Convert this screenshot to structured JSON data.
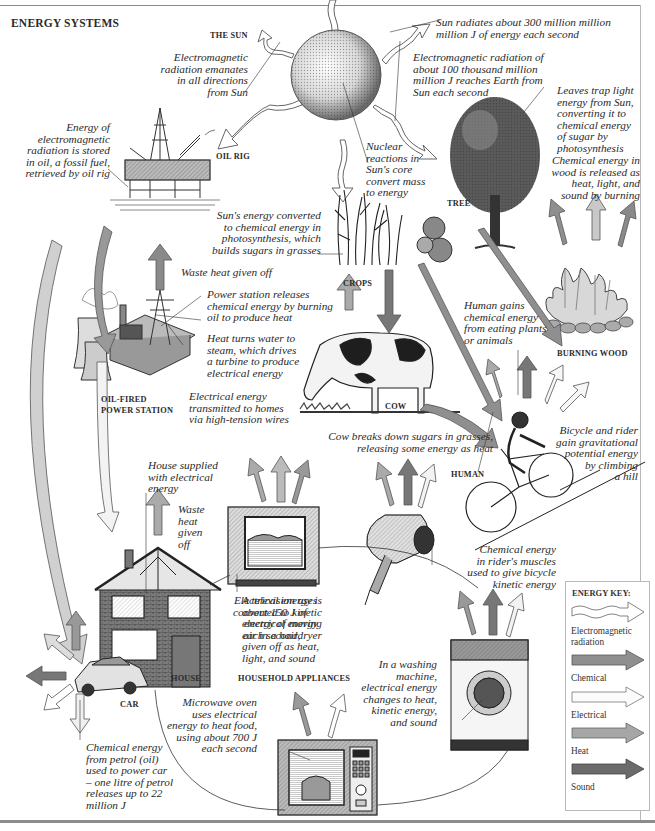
{
  "title": "ENERGY SYSTEMS",
  "labels": {
    "sun": "THE SUN",
    "oil_rig": "OIL RIG",
    "tree": "TREE",
    "crops": "CROPS",
    "burning_wood": "BURNING WOOD",
    "power_station_line1": "OIL-FIRED",
    "power_station_line2": "POWER STATION",
    "cow": "COW",
    "human": "HUMAN",
    "house": "HOUSE",
    "car": "CAR",
    "household_appliances": "HOUSEHOLD APPLIANCES"
  },
  "captions": {
    "sun_emanates": [
      "Electromagnetic",
      "radiation emanates",
      "in all directions",
      "from Sun"
    ],
    "sun_radiates": [
      "Sun radiates about 300 million million",
      "million J of energy each second"
    ],
    "reaches_earth": [
      "Electromagnetic radiation of",
      "about 100 thousand million",
      "million J reaches Earth from",
      "Sun each second"
    ],
    "oil_stored": [
      "Energy of",
      "electromagnetic",
      "radiation is stored",
      "in oil, a fossil fuel,",
      "retrieved by oil rig"
    ],
    "nuclear": [
      "Nuclear",
      "reactions in",
      "Sun's core",
      "convert mass",
      "to energy"
    ],
    "leaves": [
      "Leaves trap light",
      "energy from Sun,",
      "converting it to",
      "chemical energy",
      "of sugar by",
      "photosynthesis"
    ],
    "wood_released": [
      "Chemical energy in",
      "wood is released as",
      "heat, light, and",
      "sound by burning"
    ],
    "photosynthesis": [
      "Sun's energy converted",
      "to chemical energy in",
      "photosynthesis, which",
      "builds sugars in grasses"
    ],
    "waste_heat_station": [
      "Waste heat given off"
    ],
    "power_releases": [
      "Power station releases",
      "chemical energy by burning",
      "oil to produce heat"
    ],
    "steam_turbine": [
      "Heat turns water to",
      "steam, which drives",
      "a turbine to produce",
      "electrical energy"
    ],
    "transmitted": [
      "Electrical energy",
      "transmitted to homes",
      "via high-tension wires"
    ],
    "human_gains": [
      "Human gains",
      "chemical energy",
      "from eating plants",
      "or animals"
    ],
    "cow_breaks": [
      "Cow breaks down sugars in grasses,",
      "releasing some energy as heat"
    ],
    "bicycle_potential": [
      "Bicycle and rider",
      "gain gravitational",
      "potential energy",
      "by climbing",
      "a hill"
    ],
    "house_supplied": [
      "House supplied",
      "with electrical",
      "energy"
    ],
    "waste_heat_house": [
      "Waste",
      "heat",
      "given",
      "off"
    ],
    "television": [
      "A television uses",
      "about 150 J of",
      "electrical energy",
      "each second,",
      "given off as heat,",
      "light, and sound"
    ],
    "hairdryer": [
      "Electrical energy is",
      "converted to kinetic",
      "energy of moving",
      "air in a hairdryer"
    ],
    "rider_muscles": [
      "Chemical energy",
      "in rider's muscles",
      "used to give bicycle",
      "kinetic energy"
    ],
    "washing_machine": [
      "In a washing",
      "machine,",
      "electrical energy",
      "changes to heat,",
      "kinetic energy,",
      "and sound"
    ],
    "microwave": [
      "Microwave oven",
      "uses electrical",
      "energy to heat food,",
      "using about 700 J",
      "each second"
    ],
    "car_petrol": [
      "Chemical energy",
      "from petrol (oil)",
      "used to power car",
      "– one litre of petrol",
      "releases up to 22",
      "million J"
    ]
  },
  "microwave_display": "12:11",
  "energy_key": {
    "title": "ENERGY KEY:",
    "items": [
      {
        "label": "Electromagnetic radiation",
        "line1": "Electromagnetic",
        "line2": "radiation",
        "style": "wavy",
        "color": "#ffffff"
      },
      {
        "label": "Chemical",
        "style": "solid",
        "color": "#8f8f8f"
      },
      {
        "label": "Electrical",
        "style": "outline",
        "color": "#fbfbfb"
      },
      {
        "label": "Heat",
        "style": "solid",
        "color": "#a6a6a6"
      },
      {
        "label": "Sound",
        "style": "solid",
        "color": "#6b6b6b"
      },
      {
        "label": "Light",
        "style": "solid",
        "color": "#b9b9b9"
      },
      {
        "label": "Kinetic",
        "style": "hatched",
        "color": "#e9e9e9"
      },
      {
        "label": "Potential",
        "style": "hatched",
        "color": "#d6d6d6"
      }
    ]
  },
  "colors": {
    "chemical": "#8f8f8f",
    "electrical": "#fbfbfb",
    "heat": "#a6a6a6",
    "sound": "#6b6b6b",
    "light": "#b9b9b9",
    "kinetic": "#e9e9e9",
    "potential": "#d6d6d6",
    "outline": "#555555"
  }
}
